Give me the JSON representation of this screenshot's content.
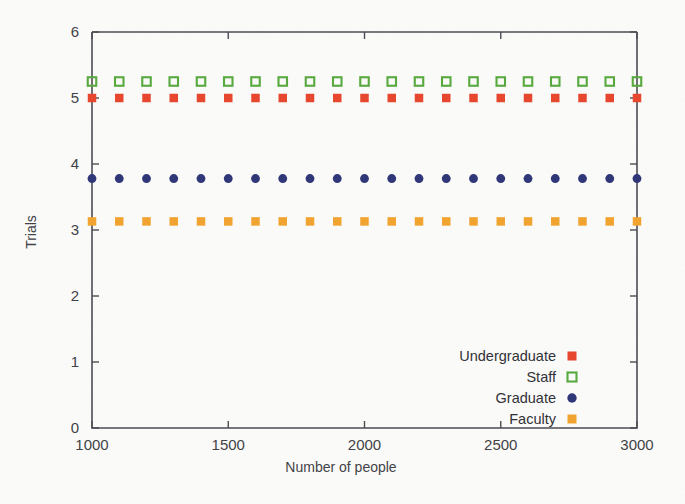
{
  "chart_data": {
    "type": "scatter",
    "title": "",
    "xlabel": "Number of people",
    "ylabel": "Trials",
    "xlim": [
      1000,
      3000
    ],
    "ylim": [
      0,
      6
    ],
    "grid": false,
    "legend_position": "bottom-right",
    "x": [
      1000,
      1100,
      1200,
      1300,
      1400,
      1500,
      1600,
      1700,
      1800,
      1900,
      2000,
      2100,
      2200,
      2300,
      2400,
      2500,
      2600,
      2700,
      2800,
      2900,
      3000
    ],
    "xticks": [
      1000,
      1500,
      2000,
      2500,
      3000
    ],
    "xtick_labels": [
      "1000",
      "1500",
      "2000",
      "2500",
      "3000"
    ],
    "yticks": [
      0,
      1,
      2,
      3,
      4,
      5,
      6
    ],
    "ytick_labels": [
      "0",
      "1",
      "2",
      "3",
      "4",
      "5",
      "6"
    ],
    "series": [
      {
        "name": "Undergraduate",
        "marker": "filled-square",
        "color": "#e8452c",
        "values": [
          5.0,
          5.0,
          5.0,
          5.0,
          5.0,
          5.0,
          5.0,
          5.0,
          5.0,
          5.0,
          5.0,
          5.0,
          5.0,
          5.0,
          5.0,
          5.0,
          5.0,
          5.0,
          5.0,
          5.0,
          5.0
        ]
      },
      {
        "name": "Staff",
        "marker": "open-square",
        "color": "#56a93c",
        "values": [
          5.25,
          5.25,
          5.25,
          5.25,
          5.25,
          5.25,
          5.25,
          5.25,
          5.25,
          5.25,
          5.25,
          5.25,
          5.25,
          5.25,
          5.25,
          5.25,
          5.25,
          5.25,
          5.25,
          5.25,
          5.25
        ]
      },
      {
        "name": "Graduate",
        "marker": "filled-circle",
        "color": "#2e3577",
        "values": [
          3.78,
          3.78,
          3.78,
          3.78,
          3.78,
          3.78,
          3.78,
          3.78,
          3.78,
          3.78,
          3.78,
          3.78,
          3.78,
          3.78,
          3.78,
          3.78,
          3.78,
          3.78,
          3.78,
          3.78,
          3.78
        ]
      },
      {
        "name": "Faculty",
        "marker": "filled-square",
        "color": "#f2a32e",
        "values": [
          3.13,
          3.13,
          3.13,
          3.13,
          3.13,
          3.13,
          3.13,
          3.13,
          3.13,
          3.13,
          3.13,
          3.13,
          3.13,
          3.13,
          3.13,
          3.13,
          3.13,
          3.13,
          3.13,
          3.13,
          3.13
        ]
      }
    ]
  },
  "axes": {
    "x_title": "Number of people",
    "y_title": "Trials"
  },
  "legend": {
    "entries": [
      {
        "label": "Undergraduate",
        "color": "#e8452c",
        "marker": "filled-square"
      },
      {
        "label": "Staff",
        "color": "#56a93c",
        "marker": "open-square"
      },
      {
        "label": "Graduate",
        "color": "#2e3577",
        "marker": "filled-circle"
      },
      {
        "label": "Faculty",
        "color": "#f2a32e",
        "marker": "filled-square"
      }
    ]
  },
  "colors": {
    "background": "#fbfbf9",
    "axis": "#4a4a52",
    "text": "#3f3f45"
  }
}
